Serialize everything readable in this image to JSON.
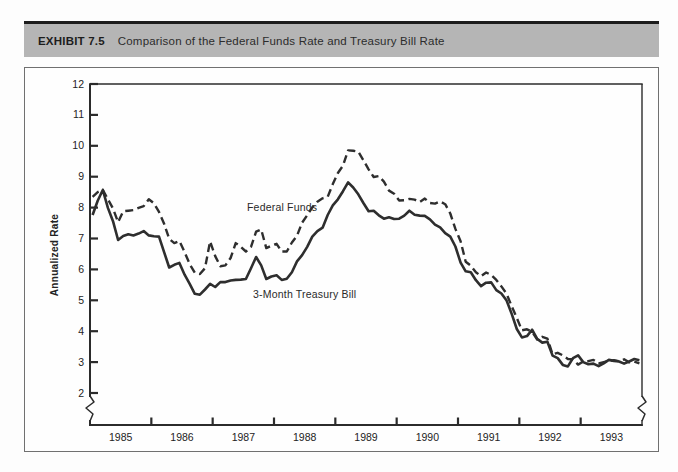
{
  "header": {
    "exhibit_label": "EXHIBIT 7.5",
    "title": "Comparison of the Federal Funds Rate and Treasury Bill Rate"
  },
  "colors": {
    "header_bar": "#b5b5b5",
    "header_top_border": "#1c1c1c",
    "box_border": "#707070",
    "ink": "#2b2b2b"
  },
  "chart_data": {
    "type": "line",
    "title": "Comparison of the Federal Funds Rate and Treasury Bill Rate",
    "xlabel": "",
    "ylabel": "Annualized Rate",
    "ylim": [
      2,
      12
    ],
    "yticks": [
      12,
      11,
      10,
      9,
      8,
      7,
      6,
      5,
      4,
      3,
      2
    ],
    "x_years": [
      "1985",
      "1986",
      "1987",
      "1988",
      "1989",
      "1990",
      "1991",
      "1992",
      "1993"
    ],
    "x_frequency": "monthly",
    "grid": false,
    "axis_break_below": 2,
    "legend": "inline-labels",
    "series": [
      {
        "name": "Federal Funds",
        "style": "dashed",
        "monthly_values": [
          8.35,
          8.5,
          8.58,
          8.27,
          7.97,
          7.53,
          7.88,
          7.9,
          7.92,
          7.99,
          8.05,
          8.27,
          8.14,
          7.86,
          7.48,
          6.99,
          6.85,
          6.92,
          6.56,
          6.17,
          5.89,
          5.85,
          6.04,
          6.91,
          6.43,
          6.1,
          6.13,
          6.37,
          6.85,
          6.73,
          6.58,
          6.73,
          7.22,
          7.29,
          6.69,
          6.77,
          6.83,
          6.58,
          6.58,
          6.87,
          7.09,
          7.51,
          7.75,
          8.01,
          8.19,
          8.3,
          8.35,
          8.76,
          9.12,
          9.36,
          9.85,
          9.84,
          9.81,
          9.53,
          9.24,
          8.99,
          9.02,
          8.84,
          8.55,
          8.45,
          8.23,
          8.24,
          8.28,
          8.26,
          8.18,
          8.29,
          8.15,
          8.13,
          8.2,
          8.11,
          7.81,
          7.31,
          6.91,
          6.25,
          6.12,
          5.91,
          5.78,
          5.9,
          5.82,
          5.66,
          5.45,
          5.21,
          4.81,
          4.43,
          4.03,
          4.06,
          3.98,
          3.73,
          3.82,
          3.76,
          3.25,
          3.3,
          3.22,
          3.1,
          3.09,
          2.92,
          3.02,
          3.03,
          3.07,
          2.96,
          3.0,
          3.04,
          3.06,
          3.03,
          3.09,
          2.99,
          3.02,
          2.96
        ]
      },
      {
        "name": "3-Month Treasury Bill",
        "style": "solid",
        "monthly_values": [
          7.76,
          8.22,
          8.57,
          7.99,
          7.56,
          6.95,
          7.08,
          7.14,
          7.1,
          7.16,
          7.24,
          7.1,
          7.07,
          7.06,
          6.56,
          6.06,
          6.15,
          6.21,
          5.83,
          5.53,
          5.21,
          5.18,
          5.35,
          5.53,
          5.43,
          5.59,
          5.59,
          5.64,
          5.66,
          5.67,
          5.69,
          6.04,
          6.4,
          6.13,
          5.69,
          5.77,
          5.81,
          5.66,
          5.7,
          5.91,
          6.26,
          6.46,
          6.73,
          7.06,
          7.24,
          7.35,
          7.76,
          8.07,
          8.27,
          8.53,
          8.82,
          8.65,
          8.43,
          8.15,
          7.88,
          7.9,
          7.75,
          7.64,
          7.69,
          7.63,
          7.64,
          7.74,
          7.9,
          7.77,
          7.74,
          7.73,
          7.62,
          7.45,
          7.36,
          7.17,
          7.06,
          6.74,
          6.22,
          5.94,
          5.91,
          5.65,
          5.46,
          5.57,
          5.58,
          5.33,
          5.22,
          4.99,
          4.56,
          4.07,
          3.8,
          3.84,
          4.05,
          3.75,
          3.63,
          3.66,
          3.21,
          3.13,
          2.91,
          2.86,
          3.13,
          3.22,
          3.0,
          2.93,
          2.95,
          2.87,
          2.96,
          3.07,
          3.04,
          3.02,
          2.95,
          3.02,
          3.1,
          3.06
        ]
      }
    ]
  }
}
